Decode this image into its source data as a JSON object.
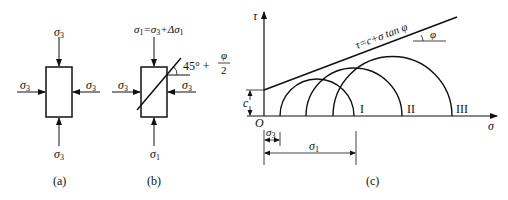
{
  "panels": {
    "a": {
      "caption": "(a)",
      "top_label": "σ",
      "top_sub": "3",
      "bottom_label": "σ",
      "bottom_sub": "3",
      "left_label": "σ",
      "left_sub": "3",
      "right_label": "σ",
      "right_sub": "3"
    },
    "b": {
      "caption": "(b)",
      "top_label": "σ",
      "top_sub1": "1",
      "top_eq": "=σ",
      "top_sub2": "3",
      "top_plus": "+Δσ",
      "top_sub3": "1",
      "bottom_label": "σ",
      "bottom_sub": "1",
      "left_label": "σ",
      "left_sub": "3",
      "right_label": "σ",
      "right_sub": "3",
      "angle_label": "45° +",
      "angle_frac_num": "φ",
      "angle_frac_den": "2"
    },
    "c": {
      "caption": "(c)",
      "y_axis_label": "τ",
      "x_axis_label": "σ",
      "origin_label": "O",
      "intercept_label": "c",
      "envelope_label": "τ=c+σ tan φ",
      "angle_label": "φ",
      "circle_labels": [
        "I",
        "II",
        "III"
      ],
      "dim_sigma3_label": "σ",
      "dim_sigma3_sub": "3",
      "dim_sigma1_label": "σ",
      "dim_sigma1_sub": "1"
    }
  },
  "colors": {
    "line": "#111111",
    "background": "#ffffff"
  }
}
